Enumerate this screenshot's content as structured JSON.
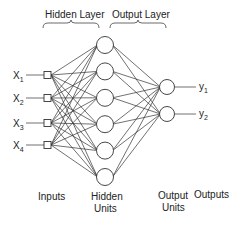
{
  "diagram": {
    "title_labels": {
      "hidden_layer": "Hidden Layer",
      "output_layer": "Output Layer"
    },
    "inputs": [
      {
        "name": "X",
        "sub": "1"
      },
      {
        "name": "X",
        "sub": "2"
      },
      {
        "name": "X",
        "sub": "3"
      },
      {
        "name": "X",
        "sub": "4"
      }
    ],
    "hidden_unit_count": 6,
    "outputs": [
      {
        "name": "y",
        "sub": "1"
      },
      {
        "name": "y",
        "sub": "2"
      }
    ],
    "bottom_labels": {
      "inputs": "Inputs",
      "hidden_units_line1": "Hidden",
      "hidden_units_line2": "Units",
      "output_units_line1": "Output",
      "output_units_line2": "Units",
      "outputs": "Outputs"
    },
    "connectivity": "fully-connected",
    "colors": {
      "stroke": "#333333",
      "background": "#ffffff"
    }
  }
}
